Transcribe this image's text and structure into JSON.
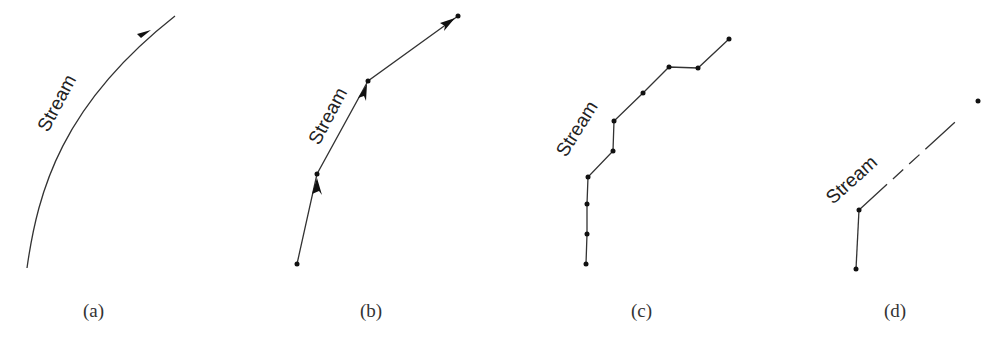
{
  "figure": {
    "panels": [
      {
        "id": "a",
        "caption": "(a)",
        "stream_label": "Stream",
        "description": "Continuous curved streamline with arrowhead",
        "path": "M27,268 C40,180 70,90 175,16",
        "arrow": {
          "x": 145,
          "y": 36,
          "angle": -35
        }
      },
      {
        "id": "b",
        "caption": "(b)",
        "stream_label": "Stream",
        "description": "Piecewise-linear streamline with arrows between points",
        "points": [
          [
            297,
            264
          ],
          [
            317,
            174
          ],
          [
            368,
            81
          ],
          [
            458,
            16
          ]
        ]
      },
      {
        "id": "c",
        "caption": "(c)",
        "stream_label": "Stream",
        "description": "Stream digitized with many vertices",
        "points": [
          [
            586,
            264
          ],
          [
            587,
            234
          ],
          [
            587,
            204
          ],
          [
            588,
            177
          ],
          [
            613,
            151
          ],
          [
            614,
            121
          ],
          [
            643,
            93
          ],
          [
            669,
            67
          ],
          [
            698,
            68
          ],
          [
            729,
            39
          ]
        ]
      },
      {
        "id": "d",
        "caption": "(d)",
        "stream_label": "Stream",
        "description": "Stream with few vertices, dashed segment",
        "points": [
          [
            856,
            269
          ],
          [
            859,
            210
          ],
          [
            978,
            101
          ]
        ]
      }
    ],
    "colors": {
      "line": "#333333",
      "text": "#222222",
      "background": "#ffffff"
    }
  }
}
